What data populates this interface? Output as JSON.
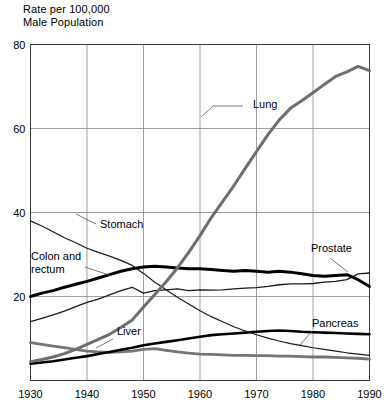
{
  "chart_data": {
    "type": "line",
    "title": "Rate per 100,000\nMale Population",
    "xlabel": "",
    "ylabel": "Rate per 100,000 Male Population",
    "xlim": [
      1930,
      1990
    ],
    "ylim": [
      0,
      80
    ],
    "xticks": [
      "1930",
      "1940",
      "1950",
      "1960",
      "1970",
      "1980",
      "1990"
    ],
    "yticks": [
      "0",
      "20",
      "40",
      "60",
      "80"
    ],
    "ytick_values": [
      0,
      20,
      40,
      60,
      80
    ],
    "ytick_labels_shown": [
      "20",
      "40",
      "60",
      "80"
    ],
    "grid": true,
    "legend_position": "inline-annotations",
    "x": [
      1930,
      1932,
      1934,
      1936,
      1938,
      1940,
      1942,
      1944,
      1946,
      1948,
      1950,
      1952,
      1954,
      1956,
      1958,
      1960,
      1962,
      1964,
      1966,
      1968,
      1970,
      1972,
      1974,
      1976,
      1978,
      1980,
      1982,
      1984,
      1986,
      1988,
      1990
    ],
    "series": [
      {
        "name": "Lung",
        "label": "Lung",
        "color": "#6e6e6e",
        "width": 3.0,
        "values": [
          4.5,
          5.0,
          5.6,
          6.4,
          7.4,
          8.6,
          9.8,
          11.0,
          12.6,
          14.4,
          17.5,
          20.5,
          23.5,
          26.8,
          30.5,
          34.5,
          38.8,
          42.6,
          46.4,
          50.5,
          54.5,
          58.5,
          62.0,
          64.8,
          66.6,
          68.5,
          70.5,
          72.4,
          73.5,
          74.8,
          73.8
        ]
      },
      {
        "name": "Stomach",
        "label": "Stomach",
        "color": "#1a1a1a",
        "width": 1.2,
        "values": [
          38.0,
          36.8,
          35.4,
          34.0,
          32.8,
          31.5,
          30.5,
          29.6,
          28.6,
          27.4,
          25.5,
          23.4,
          21.6,
          19.8,
          18.2,
          16.6,
          15.2,
          14.0,
          12.8,
          11.8,
          10.9,
          10.1,
          9.4,
          8.8,
          8.3,
          7.8,
          7.4,
          7.0,
          6.6,
          6.3,
          6.0
        ]
      },
      {
        "name": "Colon and rectum",
        "label": "Colon and\nrectum",
        "color": "#000000",
        "width": 3.0,
        "values": [
          20.0,
          20.8,
          21.4,
          22.2,
          22.9,
          23.6,
          24.4,
          25.2,
          26.0,
          26.6,
          27.0,
          27.2,
          27.0,
          26.8,
          26.6,
          26.6,
          26.4,
          26.2,
          26.0,
          26.2,
          26.0,
          25.8,
          26.0,
          25.8,
          25.4,
          25.0,
          24.8,
          25.0,
          25.2,
          24.0,
          22.4
        ]
      },
      {
        "name": "Prostate",
        "label": "Prostate",
        "color": "#1a1a1a",
        "width": 1.3,
        "values": [
          14.0,
          14.8,
          15.6,
          16.5,
          17.6,
          18.6,
          19.4,
          20.4,
          21.4,
          22.2,
          20.8,
          21.4,
          21.6,
          21.8,
          21.4,
          21.6,
          21.5,
          21.6,
          21.8,
          22.0,
          22.1,
          22.4,
          22.8,
          23.0,
          23.0,
          23.1,
          23.4,
          23.6,
          24.0,
          25.4,
          25.6
        ]
      },
      {
        "name": "Pancreas",
        "label": "Pancreas",
        "color": "#000000",
        "width": 2.6,
        "values": [
          4.0,
          4.3,
          4.6,
          5.0,
          5.4,
          5.8,
          6.3,
          6.8,
          7.3,
          7.8,
          8.4,
          8.8,
          9.2,
          9.6,
          10.0,
          10.4,
          10.8,
          11.0,
          11.2,
          11.4,
          11.6,
          11.8,
          11.9,
          11.8,
          11.6,
          11.5,
          11.4,
          11.3,
          11.2,
          11.1,
          11.0
        ]
      },
      {
        "name": "Liver",
        "label": "Liver",
        "color": "#757575",
        "width": 2.8,
        "values": [
          9.0,
          8.6,
          8.2,
          7.8,
          7.4,
          7.0,
          6.8,
          6.7,
          6.8,
          7.0,
          7.4,
          7.6,
          7.2,
          6.8,
          6.5,
          6.3,
          6.2,
          6.1,
          6.0,
          6.0,
          5.9,
          5.9,
          5.8,
          5.8,
          5.7,
          5.6,
          5.6,
          5.5,
          5.4,
          5.3,
          5.1
        ]
      }
    ],
    "annotations": [
      {
        "name": "lung-label",
        "text": "Lung",
        "x": 253,
        "y": 108
      },
      {
        "name": "stomach-label",
        "text": "Stomach",
        "x": 100,
        "y": 228
      },
      {
        "name": "colon-label-line1",
        "text": "Colon and",
        "x": 31,
        "y": 260
      },
      {
        "name": "colon-label-line2",
        "text": "rectum",
        "x": 31,
        "y": 273
      },
      {
        "name": "prostate-label",
        "text": "Prostate",
        "x": 311,
        "y": 252
      },
      {
        "name": "pancreas-label",
        "text": "Pancreas",
        "x": 312,
        "y": 327
      },
      {
        "name": "liver-label",
        "text": "Liver",
        "x": 117,
        "y": 335
      }
    ]
  }
}
